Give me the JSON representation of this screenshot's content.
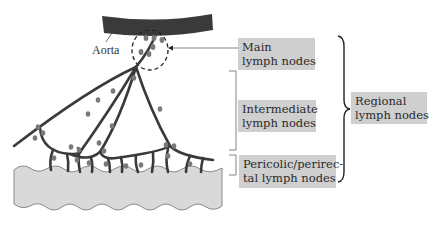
{
  "figure": {
    "type": "anatomical-diagram",
    "structures": {
      "aorta_label": "Aorta"
    },
    "labels": {
      "main": {
        "line1": "Main",
        "line2": "lymph nodes"
      },
      "intermediate": {
        "line1": "Intermediate",
        "line2": "lymph nodes"
      },
      "pericolic": {
        "line1": "Pericolic/perirec-",
        "line2": "tal lymph nodes"
      },
      "regional": {
        "line1": "Regional",
        "line2": "lymph nodes"
      }
    },
    "colors": {
      "aorta": "#3a3a3a",
      "vessel": "#3a3a3a",
      "node": "#7a7a7a",
      "colon_fill": "#d9d9d9",
      "colon_outline": "#8a8a8a",
      "label_bg": "#cfcfcf",
      "bracket": "#555555"
    }
  }
}
